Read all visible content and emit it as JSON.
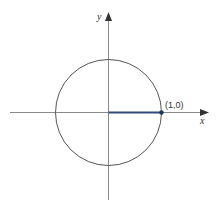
{
  "diagram": {
    "type": "unit-circle",
    "axes": {
      "x_label": "x",
      "y_label": "y"
    },
    "point": {
      "label": "(1,0)",
      "x": 1,
      "y": 0
    },
    "colors": {
      "axis": "#8a8a8a",
      "circle": "#555555",
      "radius_segment": "#2f4a7a",
      "point": "#1f3560",
      "text": "#333333"
    }
  }
}
